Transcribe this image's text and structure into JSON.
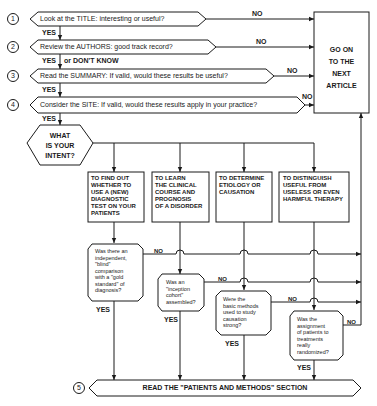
{
  "steps": [
    {
      "number": "1",
      "text": "Look at the TITLE:  interesting or useful?",
      "no_label": "NO",
      "yes_label": "YES"
    },
    {
      "number": "2",
      "text": "Review the AUTHORS:  good track record?",
      "no_label": "NO",
      "yes_label": "YES",
      "yes_suffix": "or DON'T KNOW"
    },
    {
      "number": "3",
      "text": "Read the SUMMARY:  If valid, would these results be useful?",
      "no_label": "NO",
      "yes_label": "YES"
    },
    {
      "number": "4",
      "text": "Consider the SITE:  If valid, would these results apply in your practice?",
      "no_label": "NO",
      "yes_label": "YES"
    }
  ],
  "exit_box": {
    "text": "GO ON\nTO THE\nNEXT\nARTICLE"
  },
  "intent": {
    "text": "WHAT\nIS YOUR\nINTENT?"
  },
  "intents": [
    {
      "text": "TO FIND OUT\nWHETHER TO\nUSE A (NEW)\nDIAGNOSTIC\nTEST ON YOUR\nPATIENTS"
    },
    {
      "text": "TO LEARN\nTHE CLINICAL\nCOURSE AND\nPROGNOSIS\nOF A DISORDER"
    },
    {
      "text": "TO DETERMINE\nETIOLOGY OR\nCAUSATION"
    },
    {
      "text": "TO DISTINGUISH\nUSEFUL FROM\nUSELESS OR EVEN\nHARMFUL THERAPY"
    }
  ],
  "questions": [
    {
      "text": "Was there an\nindependent,\n\"blind\"\ncomparison\nwith a \"gold\nstandard\" of\ndiagnosis?",
      "no_label": "NO",
      "yes_label": "YES"
    },
    {
      "text": "Was an\n\"inception\ncohort\"\nassembled?",
      "no_label": "NO",
      "yes_label": "YES"
    },
    {
      "text": "Were the\nbasic methods\nused to study\ncausation\nstrong?",
      "no_label": "NO",
      "yes_label": "YES"
    },
    {
      "text": "Was the\nassignment\nof patients to\ntreatments\nreally\nrandomized?",
      "no_label": "NO",
      "yes_label": "YES"
    }
  ],
  "final_step": {
    "number": "5",
    "text": "READ THE \"PATIENTS AND METHODS\" SECTION"
  },
  "colors": {
    "ink": "#1a1a1a",
    "paper": "#ffffff"
  }
}
